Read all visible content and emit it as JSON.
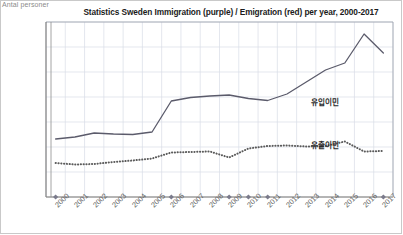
{
  "chart_data": {
    "type": "line",
    "title": "Statistics Sweden Immigration (purple) / Emigration (red) per year, 2000-2017",
    "xlabel": "",
    "ylabel": "Antal personer",
    "ylim": [
      0,
      175000
    ],
    "ytick_values": [
      0,
      25000,
      50000,
      75000,
      100000,
      125000,
      150000,
      175000
    ],
    "ytick_labels": [
      "0",
      "25 000",
      "50 000",
      "75 000",
      "100 000",
      "125 000",
      "150 000",
      "175 000"
    ],
    "grid": true,
    "legend_position": "inline-annotation",
    "categories": [
      "2000",
      "2001",
      "2002",
      "2003",
      "2004",
      "2005",
      "2006",
      "2007",
      "2008",
      "2009",
      "2010",
      "2011",
      "2012",
      "2013",
      "2014",
      "2015",
      "2016",
      "2017"
    ],
    "series": [
      {
        "name": "유입이민",
        "meaning": "Immigration (purple)",
        "color": "#5b5b6b",
        "style": "solid",
        "annotation": "유입이민",
        "values": [
          58000,
          60000,
          64000,
          63000,
          62500,
          65000,
          96000,
          99500,
          101000,
          102000,
          98500,
          96500,
          103000,
          115000,
          127000,
          134000,
          163000,
          144000
        ]
      },
      {
        "name": "유출이민",
        "meaning": "Emigration (red)",
        "color": "#5b5b5b",
        "style": "dotted",
        "annotation": "유출이민",
        "values": [
          34000,
          32500,
          33000,
          35000,
          36500,
          38500,
          44500,
          45000,
          45500,
          39500,
          48500,
          51000,
          51500,
          50500,
          51000,
          55500,
          45500,
          46000
        ]
      }
    ],
    "axis_markers": {
      "description": "diamond markers on x-axis baseline",
      "years": [
        "2000",
        "2006",
        "2009",
        "2010",
        "2011",
        "2017"
      ]
    },
    "annotations": [
      {
        "text": "유입이민",
        "x_px": 311,
        "y_px": 96
      },
      {
        "text": "유출이민",
        "x_px": 311,
        "y_px": 139
      }
    ]
  }
}
